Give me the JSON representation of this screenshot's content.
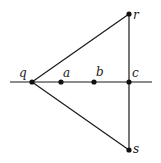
{
  "diagram": {
    "points": {
      "q": {
        "label": "q",
        "x": 32,
        "y": 82
      },
      "a": {
        "label": "a",
        "x": 61,
        "y": 82
      },
      "b": {
        "label": "b",
        "x": 94,
        "y": 82
      },
      "c": {
        "label": "c",
        "x": 129,
        "y": 82
      },
      "r": {
        "label": "r",
        "x": 129,
        "y": 14
      },
      "s": {
        "label": "s",
        "x": 129,
        "y": 150
      }
    },
    "segments": [
      [
        "q",
        "r"
      ],
      [
        "q",
        "s"
      ],
      [
        "r",
        "s"
      ]
    ],
    "line": {
      "x1": 10,
      "y1": 82,
      "x2": 152,
      "y2": 82
    },
    "colors": {
      "stroke": "#1a1a1a",
      "point": "#111111",
      "background": "#ffffff"
    }
  }
}
